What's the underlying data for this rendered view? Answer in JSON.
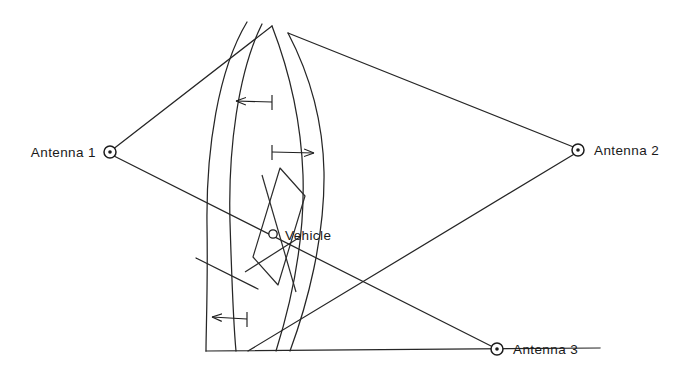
{
  "diagram": {
    "type": "hyperbolic-navigation-lines-of-position",
    "background_color": "#ffffff",
    "stroke_color": "#262626",
    "nodes": [
      {
        "id": "antenna1",
        "label": "Antenna 1",
        "x": 110,
        "y": 152,
        "label_side": "left",
        "label_x": 96,
        "label_y": 157
      },
      {
        "id": "antenna2",
        "label": "Antenna 2",
        "x": 578,
        "y": 150,
        "label_side": "right",
        "label_x": 594,
        "label_y": 155
      },
      {
        "id": "antenna3",
        "label": "Antenna 3",
        "x": 497,
        "y": 349,
        "label_side": "right",
        "label_x": 513,
        "label_y": 354
      },
      {
        "id": "vehicle",
        "label": "Vehicle",
        "x": 273,
        "y": 234,
        "label_side": "right",
        "label_x": 285,
        "label_y": 240
      }
    ],
    "arrows": [
      {
        "id": "lane-arrow-upper-left",
        "direction": "left",
        "from_x": 272,
        "from_y": 102,
        "to_x": 232,
        "to_y": 101
      },
      {
        "id": "lane-arrow-upper-right",
        "direction": "right",
        "from_x": 272,
        "from_y": 152,
        "to_x": 318,
        "to_y": 153
      },
      {
        "id": "lane-arrow-lower-left",
        "direction": "left",
        "from_x": 247,
        "from_y": 319,
        "to_x": 208,
        "to_y": 317
      }
    ],
    "arcs": [
      {
        "id": "arc-1",
        "description": "leftmost hyperbolic line of position"
      },
      {
        "id": "arc-2",
        "description": "second hyperbolic line of position"
      },
      {
        "id": "arc-3",
        "description": "third hyperbolic line of position"
      },
      {
        "id": "arc-4",
        "description": "rightmost hyperbolic line of position"
      }
    ],
    "baseline": {
      "id": "ground-baseline",
      "x1": 206,
      "y1": 351,
      "x2": 600,
      "y2": 348
    },
    "lop_polygon": {
      "id": "position-cell",
      "description": "quadrilateral cell formed by crossing lines of position around the vehicle"
    },
    "baseline_lines": [
      {
        "id": "antenna1-to-apex",
        "from": "antenna1",
        "to": "top-apex"
      },
      {
        "id": "apex-to-antenna2",
        "from": "top-apex",
        "to": "antenna2"
      },
      {
        "id": "antenna1-to-antenna3",
        "from": "antenna1",
        "to": "antenna3"
      },
      {
        "id": "antenna2-to-lower",
        "from": "antenna2",
        "to": "lower-left"
      }
    ]
  }
}
